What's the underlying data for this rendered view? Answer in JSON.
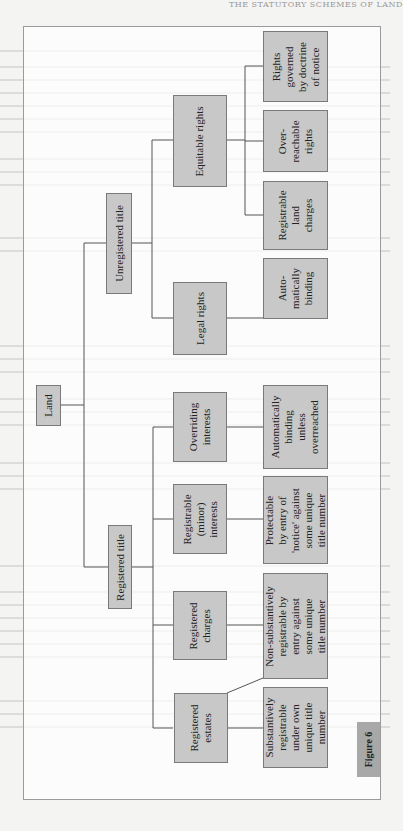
{
  "page": {
    "running_header": "THE STATUTORY SCHEMES OF LAND",
    "figure_label": "Figure 6"
  },
  "diagram": {
    "root": {
      "id": "land",
      "label": "Land"
    },
    "level1": [
      {
        "id": "registered-title",
        "label": "Registered title"
      },
      {
        "id": "unregistered-title",
        "label": "Unregistered title"
      }
    ],
    "level2": [
      {
        "id": "registered-estates",
        "label": "Registered\nestates",
        "parent": "registered-title"
      },
      {
        "id": "registered-charges",
        "label": "Registered\ncharges",
        "parent": "registered-title"
      },
      {
        "id": "registrable-minor-interests",
        "label": "Registrable\n(minor)\ninterests",
        "parent": "registered-title"
      },
      {
        "id": "overriding-interests",
        "label": "Overriding\ninterests",
        "parent": "registered-title"
      },
      {
        "id": "legal-rights",
        "label": "Legal rights",
        "parent": "unregistered-title"
      },
      {
        "id": "equitable-rights",
        "label": "Equitable rights",
        "parent": "unregistered-title"
      }
    ],
    "leaves": [
      {
        "id": "substantively-registrable",
        "label": "Substantively\nregistrable\nunder own\nunique title\nnumber",
        "parent": "registered-estates"
      },
      {
        "id": "non-substantively-registrable",
        "label": "Non-substantively\nregistrable by\nentry against\nsome unique\ntitle number",
        "parent": "registered-charges"
      },
      {
        "id": "protectable-by-notice",
        "label": "Protectable\nby entry of\n'notice' against\nsome unique\ntitle number",
        "parent": "registrable-minor-interests"
      },
      {
        "id": "automatically-binding-unless-overreached",
        "label": "Automatically\nbinding\nunless\noverreached",
        "parent": "overriding-interests"
      },
      {
        "id": "automatically-binding",
        "label": "Auto-\nmatically\nbinding",
        "parent": "legal-rights"
      },
      {
        "id": "registrable-land-charges",
        "label": "Registrable\nland\ncharges",
        "parent": "equitable-rights"
      },
      {
        "id": "overreachable-rights",
        "label": "Over-\nreachable\nrights",
        "parent": "equitable-rights"
      },
      {
        "id": "rights-governed-by-notice",
        "label": "Rights\ngoverned\nby doctrine\nof notice",
        "parent": "equitable-rights"
      }
    ]
  },
  "colors": {
    "box_fill": "#c8c8c8",
    "box_border": "#7a7a7a",
    "connector": "#555555",
    "figure_tab": "#a8a8a8",
    "frame_border": "#9a9a9a"
  }
}
